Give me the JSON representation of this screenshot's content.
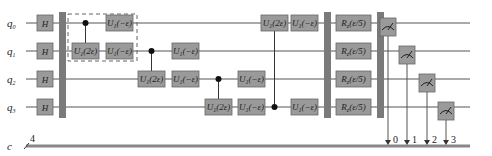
{
  "diagram": {
    "type": "quantum-circuit",
    "qubits": [
      {
        "name": "q",
        "index": "0"
      },
      {
        "name": "q",
        "index": "1"
      },
      {
        "name": "q",
        "index": "2"
      },
      {
        "name": "q",
        "index": "3"
      }
    ],
    "classical_register": {
      "name": "c",
      "size": "4"
    },
    "hadamard_label": "H",
    "controlled_gates": [
      {
        "control": 0,
        "target": 1,
        "label": "U",
        "sub": "1",
        "arg": "(2ε)"
      },
      {
        "control": 1,
        "target": 2,
        "label": "U",
        "sub": "1",
        "arg": "(2ε)"
      },
      {
        "control": 2,
        "target": 3,
        "label": "U",
        "sub": "1",
        "arg": "(2ε)"
      },
      {
        "control": 3,
        "target": 0,
        "label": "U",
        "sub": "1",
        "arg": "(2ε)"
      }
    ],
    "single_gates": [
      {
        "qubit": 0,
        "step": 0,
        "label": "U",
        "sub": "1",
        "arg": "(−ε)"
      },
      {
        "qubit": 1,
        "step": 0,
        "label": "U",
        "sub": "1",
        "arg": "(−ε)"
      },
      {
        "qubit": 1,
        "step": 1,
        "label": "U",
        "sub": "1",
        "arg": "(−ε)"
      },
      {
        "qubit": 2,
        "step": 1,
        "label": "U",
        "sub": "1",
        "arg": "(−ε)"
      },
      {
        "qubit": 2,
        "step": 2,
        "label": "U",
        "sub": "1",
        "arg": "(−ε)"
      },
      {
        "qubit": 3,
        "step": 2,
        "label": "U",
        "sub": "1",
        "arg": "(−ε)"
      },
      {
        "qubit": 0,
        "step": 3,
        "label": "U",
        "sub": "1",
        "arg": "(−ε)"
      },
      {
        "qubit": 3,
        "step": 3,
        "label": "U",
        "sub": "1",
        "arg": "(−ε)"
      }
    ],
    "rotation_gates": [
      {
        "qubit": 0,
        "label": "R",
        "sub": "z",
        "arg": "(ε/5)"
      },
      {
        "qubit": 1,
        "label": "R",
        "sub": "z",
        "arg": "(ε/5)"
      },
      {
        "qubit": 2,
        "label": "R",
        "sub": "z",
        "arg": "(ε/5)"
      },
      {
        "qubit": 3,
        "label": "R",
        "sub": "z",
        "arg": "(ε/5)"
      }
    ],
    "measurements": [
      {
        "qubit": 0,
        "bit": "0"
      },
      {
        "qubit": 1,
        "bit": "1"
      },
      {
        "qubit": 2,
        "bit": "2"
      },
      {
        "qubit": 3,
        "bit": "3"
      }
    ],
    "barriers": 3,
    "dashed_group": {
      "covers_step": 0,
      "qubits": [
        0,
        1
      ]
    }
  }
}
